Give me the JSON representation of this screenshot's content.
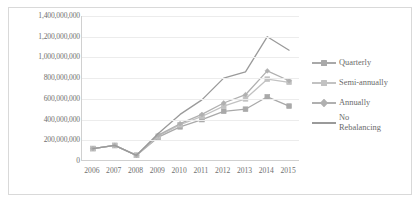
{
  "chart_data": {
    "type": "line",
    "title": "",
    "subtitle": "",
    "xlabel": "",
    "ylabel": "",
    "categories": [
      "2006",
      "2007",
      "2008",
      "2009",
      "2010",
      "2011",
      "2012",
      "2013",
      "2014",
      "2015"
    ],
    "ylim": [
      0,
      1400000000
    ],
    "ytick_values": [
      0,
      200000000,
      400000000,
      600000000,
      800000000,
      1000000000,
      1200000000,
      1400000000
    ],
    "ytick_labels": [
      "0",
      "200,000,000",
      "400,000,000",
      "600,000,000",
      "800,000,000",
      "1,000,000,000",
      "1,200,000,000",
      "1,400,000,000"
    ],
    "grid": true,
    "legend_position": "right",
    "series": [
      {
        "name": "Quarterly",
        "color": "#a9a9a9",
        "marker": "square",
        "values": [
          120000000,
          150000000,
          55000000,
          230000000,
          330000000,
          400000000,
          480000000,
          500000000,
          620000000,
          530000000
        ]
      },
      {
        "name": "Semi-annually",
        "color": "#c2c2c2",
        "marker": "square",
        "values": [
          120000000,
          150000000,
          55000000,
          240000000,
          350000000,
          430000000,
          530000000,
          600000000,
          790000000,
          760000000
        ]
      },
      {
        "name": "Annually",
        "color": "#b0b0b0",
        "marker": "diamond",
        "values": [
          120000000,
          150000000,
          55000000,
          250000000,
          360000000,
          450000000,
          560000000,
          640000000,
          870000000,
          775000000
        ]
      },
      {
        "name": "No\nRebalancing",
        "color": "#9a9a9a",
        "marker": "none",
        "values": [
          120000000,
          150000000,
          55000000,
          265000000,
          450000000,
          590000000,
          800000000,
          860000000,
          1200000000,
          1070000000
        ]
      }
    ]
  },
  "legend": {
    "items": [
      {
        "label": "Quarterly"
      },
      {
        "label": "Semi-annually"
      },
      {
        "label": "Annually"
      },
      {
        "label": "No\nRebalancing"
      }
    ]
  }
}
